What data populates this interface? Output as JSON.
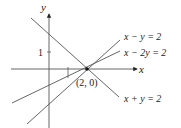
{
  "diagram": {
    "type": "coordinate-plane-lines",
    "axes": {
      "x_label": "x",
      "y_label": "y"
    },
    "ticks": {
      "y_tick_label": "1",
      "x_tick_value": 1
    },
    "intersection": {
      "label": "(2, 0)",
      "x": 2,
      "y": 0
    },
    "lines": [
      {
        "equation": "x − y = 2",
        "slope": 1,
        "intercept": -2
      },
      {
        "equation": "x − 2y = 2",
        "slope": 0.5,
        "intercept": -1
      },
      {
        "equation": "x + y = 2",
        "slope": -1,
        "intercept": 2
      }
    ],
    "colors": {
      "line": "#555555",
      "text": "#222222",
      "background": "#ffffff"
    }
  }
}
